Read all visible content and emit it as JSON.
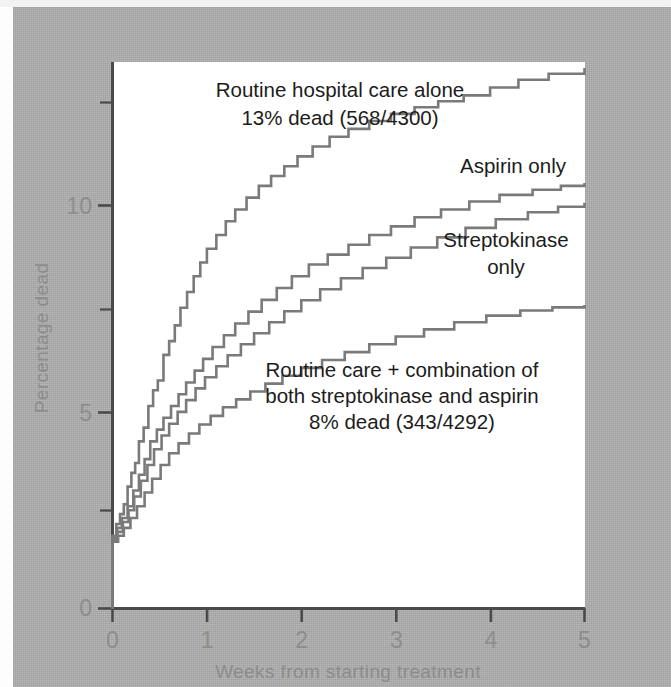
{
  "figure": {
    "plot_background": "#ffffff",
    "page_background": "#aeaeae",
    "curve_color": "#7a7a7a",
    "axis_color": "#4a4a4a",
    "tick_label_color": "#8d8d8d",
    "annotation_color": "#1c1c1c"
  },
  "axes": {
    "x_title": "Weeks from starting treatment",
    "y_title": "Percentage dead",
    "x_ticks": [
      "0",
      "1",
      "2",
      "3",
      "4",
      "5"
    ],
    "y_ticks": [
      "0",
      "5",
      "10"
    ]
  },
  "annotations": {
    "control": {
      "line1": "Routine hospital care alone",
      "line2": "13% dead (568/4300)"
    },
    "aspirin": {
      "line1": "Aspirin only"
    },
    "streptokinase": {
      "line1": "Streptokinase",
      "line2": "only"
    },
    "combination": {
      "line1": "Routine care + combination of",
      "line2": "both streptokinase and aspirin",
      "line3": "8% dead (343/4292)"
    }
  },
  "chart_data": {
    "type": "line",
    "title": "",
    "xlabel": "Weeks from starting treatment",
    "ylabel": "Percentage dead",
    "xlim": [
      0,
      5
    ],
    "ylim": [
      0,
      13.9
    ],
    "x_ticks": [
      0,
      1,
      2,
      3,
      4,
      5
    ],
    "y_ticks": [
      0,
      5,
      10
    ],
    "y_minor_ticks": [
      2.5,
      7.5,
      12.5
    ],
    "grid": false,
    "legend": "inline-annotations",
    "step": "post",
    "series": [
      {
        "name": "Routine hospital care alone",
        "label": "Routine hospital care alone 13% dead (568/4300)",
        "final_value": 13.0,
        "deaths": 568,
        "total": 4300,
        "percent_dead": 13,
        "x": [
          0.0,
          0.04,
          0.08,
          0.12,
          0.16,
          0.2,
          0.24,
          0.28,
          0.33,
          0.38,
          0.43,
          0.48,
          0.54,
          0.6,
          0.66,
          0.72,
          0.79,
          0.86,
          0.93,
          1.0,
          1.1,
          1.2,
          1.3,
          1.42,
          1.55,
          1.68,
          1.82,
          1.96,
          2.12,
          2.3,
          2.5,
          2.72,
          2.95,
          3.2,
          3.45,
          3.72,
          4.0,
          4.3,
          4.62,
          5.0
        ],
        "y": [
          1.85,
          2.15,
          2.4,
          2.65,
          3.1,
          3.45,
          3.7,
          4.25,
          4.6,
          5.15,
          5.55,
          5.8,
          6.45,
          6.8,
          7.2,
          7.65,
          8.05,
          8.45,
          8.8,
          9.15,
          9.5,
          9.85,
          10.15,
          10.45,
          10.75,
          11.0,
          11.25,
          11.5,
          11.75,
          12.0,
          12.2,
          12.4,
          12.58,
          12.75,
          12.9,
          13.05,
          13.25,
          13.45,
          13.6,
          13.75
        ]
      },
      {
        "name": "Aspirin only",
        "label": "Aspirin only",
        "final_value": 10.8,
        "x": [
          0.0,
          0.05,
          0.1,
          0.16,
          0.22,
          0.28,
          0.34,
          0.4,
          0.47,
          0.54,
          0.62,
          0.7,
          0.78,
          0.87,
          0.96,
          1.06,
          1.18,
          1.3,
          1.44,
          1.58,
          1.74,
          1.9,
          2.08,
          2.28,
          2.5,
          2.72,
          2.95,
          3.2,
          3.48,
          3.78,
          4.1,
          4.45,
          4.75,
          5.0
        ],
        "y": [
          1.8,
          2.05,
          2.3,
          2.6,
          3.0,
          3.4,
          3.8,
          4.25,
          4.55,
          4.85,
          5.15,
          5.45,
          5.75,
          6.05,
          6.35,
          6.65,
          6.95,
          7.25,
          7.55,
          7.85,
          8.15,
          8.45,
          8.75,
          9.0,
          9.25,
          9.5,
          9.72,
          9.95,
          10.15,
          10.35,
          10.52,
          10.65,
          10.75,
          10.82
        ]
      },
      {
        "name": "Streptokinase only",
        "label": "Streptokinase only",
        "final_value": 10.3,
        "x": [
          0.0,
          0.05,
          0.11,
          0.17,
          0.23,
          0.3,
          0.37,
          0.44,
          0.52,
          0.6,
          0.69,
          0.78,
          0.88,
          0.98,
          1.1,
          1.22,
          1.36,
          1.5,
          1.66,
          1.82,
          2.0,
          2.2,
          2.42,
          2.65,
          2.9,
          3.16,
          3.44,
          3.74,
          4.06,
          4.4,
          4.72,
          5.0
        ],
        "y": [
          1.75,
          1.95,
          2.2,
          2.5,
          2.85,
          3.25,
          3.65,
          4.05,
          4.4,
          4.7,
          5.0,
          5.3,
          5.6,
          5.88,
          6.16,
          6.44,
          6.72,
          7.0,
          7.28,
          7.56,
          7.84,
          8.12,
          8.4,
          8.66,
          8.92,
          9.18,
          9.44,
          9.68,
          9.9,
          10.08,
          10.22,
          10.32
        ]
      },
      {
        "name": "Routine care + combination of both streptokinase and aspirin",
        "label": "Routine care + combination of both streptokinase and aspirin 8% dead (343/4292)",
        "final_value": 7.7,
        "deaths": 343,
        "total": 4292,
        "percent_dead": 8,
        "x": [
          0.0,
          0.06,
          0.12,
          0.19,
          0.26,
          0.34,
          0.42,
          0.51,
          0.6,
          0.7,
          0.81,
          0.92,
          1.04,
          1.17,
          1.31,
          1.46,
          1.62,
          1.8,
          2.0,
          2.22,
          2.46,
          2.72,
          3.0,
          3.3,
          3.62,
          3.96,
          4.32,
          4.66,
          5.0
        ],
        "y": [
          1.7,
          1.85,
          2.05,
          2.3,
          2.6,
          2.95,
          3.3,
          3.65,
          3.95,
          4.2,
          4.45,
          4.68,
          4.9,
          5.12,
          5.32,
          5.52,
          5.72,
          5.92,
          6.12,
          6.32,
          6.52,
          6.72,
          6.92,
          7.1,
          7.28,
          7.45,
          7.58,
          7.66,
          7.72
        ]
      }
    ]
  }
}
